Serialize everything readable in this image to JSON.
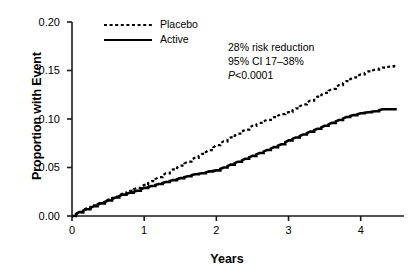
{
  "chart_data": {
    "type": "line",
    "title": "",
    "subtitle": "",
    "xlabel": "Years",
    "ylabel": "Proportion with Event",
    "xlim": [
      0,
      4.6
    ],
    "ylim": [
      0,
      0.2
    ],
    "xticks": [
      0,
      1,
      2,
      3,
      4
    ],
    "xtick_labels": [
      "0",
      "1",
      "2",
      "3",
      "4"
    ],
    "yticks": [
      0.0,
      0.05,
      0.1,
      0.15,
      0.2
    ],
    "ytick_labels": [
      "0.00",
      "0.05",
      "0.10",
      "0.15",
      "0.20"
    ],
    "grid": false,
    "legend_position": "top-left-inside",
    "series": [
      {
        "name": "Placebo",
        "style": "dotted",
        "color": "#000000",
        "x": [
          0,
          0.1,
          0.2,
          0.3,
          0.4,
          0.5,
          0.6,
          0.7,
          0.8,
          0.9,
          1.0,
          1.1,
          1.2,
          1.3,
          1.4,
          1.5,
          1.6,
          1.7,
          1.8,
          1.9,
          2.0,
          2.1,
          2.2,
          2.3,
          2.4,
          2.5,
          2.6,
          2.7,
          2.8,
          2.9,
          3.0,
          3.1,
          3.2,
          3.3,
          3.4,
          3.5,
          3.6,
          3.7,
          3.8,
          3.9,
          4.0,
          4.1,
          4.2,
          4.3,
          4.4,
          4.5
        ],
        "y": [
          0.0,
          0.004,
          0.008,
          0.011,
          0.014,
          0.017,
          0.02,
          0.023,
          0.026,
          0.029,
          0.032,
          0.036,
          0.04,
          0.044,
          0.048,
          0.052,
          0.056,
          0.06,
          0.064,
          0.068,
          0.073,
          0.077,
          0.081,
          0.085,
          0.089,
          0.093,
          0.096,
          0.099,
          0.102,
          0.105,
          0.107,
          0.111,
          0.115,
          0.119,
          0.123,
          0.127,
          0.131,
          0.135,
          0.139,
          0.143,
          0.146,
          0.149,
          0.151,
          0.153,
          0.154,
          0.155
        ]
      },
      {
        "name": "Active",
        "style": "solid",
        "color": "#000000",
        "x": [
          0,
          0.1,
          0.2,
          0.3,
          0.4,
          0.5,
          0.6,
          0.7,
          0.8,
          0.9,
          1.0,
          1.1,
          1.2,
          1.3,
          1.4,
          1.5,
          1.6,
          1.7,
          1.8,
          1.9,
          2.0,
          2.1,
          2.2,
          2.3,
          2.4,
          2.5,
          2.6,
          2.7,
          2.8,
          2.9,
          3.0,
          3.1,
          3.2,
          3.3,
          3.4,
          3.5,
          3.6,
          3.7,
          3.8,
          3.9,
          4.0,
          4.1,
          4.2,
          4.3,
          4.4,
          4.5
        ],
        "y": [
          0.0,
          0.004,
          0.007,
          0.01,
          0.013,
          0.016,
          0.019,
          0.022,
          0.024,
          0.026,
          0.029,
          0.031,
          0.033,
          0.035,
          0.037,
          0.039,
          0.041,
          0.043,
          0.044,
          0.046,
          0.047,
          0.05,
          0.053,
          0.056,
          0.059,
          0.062,
          0.065,
          0.068,
          0.071,
          0.074,
          0.078,
          0.081,
          0.084,
          0.087,
          0.09,
          0.093,
          0.096,
          0.099,
          0.102,
          0.104,
          0.106,
          0.107,
          0.108,
          0.11,
          0.11,
          0.11
        ]
      }
    ],
    "annotations": [
      "28% risk reduction",
      "95% CI 17–38%",
      "P<0.0001"
    ]
  },
  "legend": {
    "items": [
      {
        "label": "Placebo"
      },
      {
        "label": "Active"
      }
    ]
  },
  "stats": {
    "risk_reduction": "28% risk reduction",
    "confidence_interval": "95% CI 17–38%",
    "p_value_prefix": "P",
    "p_value_rest": "<0.0001"
  }
}
